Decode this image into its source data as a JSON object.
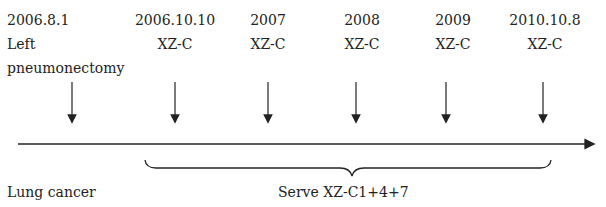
{
  "events": [
    {
      "date": "2006.8.1",
      "line2": "Left",
      "line3": "pneumonectomy",
      "x": 72
    },
    {
      "date": "2006.10.10",
      "line2": "XZ-C",
      "x": 175
    },
    {
      "date": "2007",
      "line2": "XZ-C",
      "x": 268
    },
    {
      "date": "2008",
      "line2": "XZ-C",
      "x": 356
    },
    {
      "date": "2009",
      "line2": "XZ-C",
      "x": 446
    },
    {
      "date": "2010.10.8",
      "line2": "XZ-C",
      "x": 543
    }
  ],
  "bottom": {
    "left_label": "Lung cancer",
    "brace_label": "Serve XZ-C1+4+7"
  }
}
